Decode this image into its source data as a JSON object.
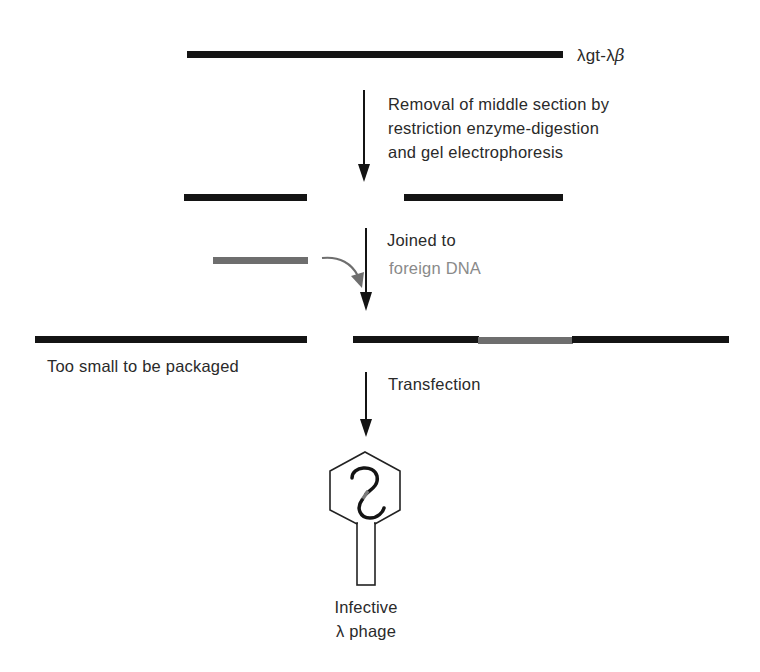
{
  "colors": {
    "vector_dna": "#141414",
    "foreign_dna": "#6e6e6e",
    "foreign_label": "#8a8a8a",
    "text": "#2a2a2a",
    "background": "#ffffff"
  },
  "step1": {
    "label": "λgt-λβ",
    "label_main": "λgt-λ",
    "label_beta": "β"
  },
  "step2": {
    "line1": "Removal of middle section by",
    "line2": "restriction enzyme-digestion",
    "line3": "and gel electrophoresis"
  },
  "step3": {
    "line1": "Joined to",
    "line2": "foreign DNA"
  },
  "step4": {
    "left_label": "Too small to be packaged",
    "arrow_label": "Transfection"
  },
  "result": {
    "line1": "Infective",
    "line2": "λ phage"
  }
}
